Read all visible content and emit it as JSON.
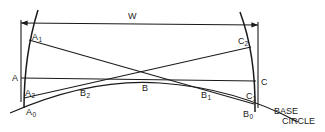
{
  "diagram": {
    "dimension_label": "W",
    "points": {
      "A": {
        "text": "A",
        "sub": ""
      },
      "A1": {
        "text": "A",
        "sub": "1"
      },
      "A2": {
        "text": "A",
        "sub": "2"
      },
      "A0": {
        "text": "A",
        "sub": "0"
      },
      "B": {
        "text": "B",
        "sub": ""
      },
      "B1": {
        "text": "B",
        "sub": "1"
      },
      "B2": {
        "text": "B",
        "sub": "2"
      },
      "B0": {
        "text": "B",
        "sub": "0"
      },
      "C": {
        "text": "C",
        "sub": ""
      },
      "C1": {
        "text": "C",
        "sub": "1"
      },
      "C2": {
        "text": "C",
        "sub": "2"
      }
    },
    "base_circle_label_line1": "BASE",
    "base_circle_label_line2": "CIRCLE",
    "line_color": "#1a1a1a",
    "background": "#ffffff"
  }
}
